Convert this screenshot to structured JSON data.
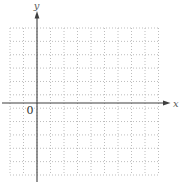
{
  "figure": {
    "type": "blank-coordinate-plane",
    "background": "#ffffff",
    "labels": {
      "x_axis": "x",
      "y_axis": "y",
      "origin": "0"
    },
    "grid": {
      "columns": 11,
      "rows": 11,
      "style": "dotted",
      "color": "#bdbdbd"
    },
    "axes": {
      "color": "#3f3f3f",
      "x_axis_on_grid": true,
      "y_axis_on_grid": true
    }
  }
}
